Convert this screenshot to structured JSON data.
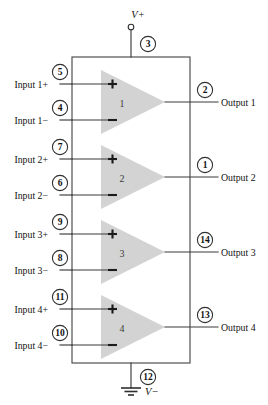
{
  "diagram": {
    "background_color": "#ffffff",
    "wire_color": "#3a3a3a",
    "amp_fill_color": "#d3d3d3",
    "power": {
      "positive_rail_label": "V+",
      "positive_rail_pin": "3",
      "negative_rail_label": "V−",
      "negative_rail_pin": "12",
      "ground_symbol": "earth-ground"
    },
    "amplifiers": [
      {
        "number": "1",
        "plus_sign": "+",
        "minus_sign": "−",
        "inputs": [
          {
            "label": "Input 1+",
            "pin": "5",
            "polarity": "+"
          },
          {
            "label": "Input 1−",
            "pin": "4",
            "polarity": "−"
          }
        ],
        "output": {
          "label": "Output 1",
          "pin": "2"
        }
      },
      {
        "number": "2",
        "plus_sign": "+",
        "minus_sign": "−",
        "inputs": [
          {
            "label": "Input 2+",
            "pin": "7",
            "polarity": "+"
          },
          {
            "label": "Input 2−",
            "pin": "6",
            "polarity": "−"
          }
        ],
        "output": {
          "label": "Output 2",
          "pin": "1"
        }
      },
      {
        "number": "3",
        "plus_sign": "+",
        "minus_sign": "−",
        "inputs": [
          {
            "label": "Input 3+",
            "pin": "9",
            "polarity": "+"
          },
          {
            "label": "Input 3−",
            "pin": "8",
            "polarity": "−"
          }
        ],
        "output": {
          "label": "Output 3",
          "pin": "14"
        }
      },
      {
        "number": "4",
        "plus_sign": "+",
        "minus_sign": "−",
        "inputs": [
          {
            "label": "Input 4+",
            "pin": "11",
            "polarity": "+"
          },
          {
            "label": "Input 4−",
            "pin": "10",
            "polarity": "−"
          }
        ],
        "output": {
          "label": "Output 4",
          "pin": "13"
        }
      }
    ]
  }
}
